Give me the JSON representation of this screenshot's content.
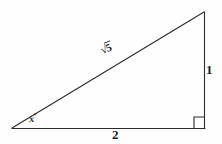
{
  "figure": {
    "type": "right-triangle-diagram",
    "background_color": "#fefefe",
    "stroke_color": "#2b2b2b",
    "stroke_width": 1,
    "vertices": {
      "left": {
        "x": 12,
        "y": 128
      },
      "bottom_right": {
        "x": 205,
        "y": 128
      },
      "top_right": {
        "x": 204,
        "y": 12
      }
    },
    "right_angle_marker": {
      "name": "right-angle-square",
      "corner_x": 205,
      "corner_y": 128,
      "size": 11
    },
    "labels": {
      "vertical_leg": "1",
      "horizontal_leg": "2",
      "hypotenuse_radical": "√",
      "hypotenuse_radicand": "5",
      "angle": "x",
      "angle_degree_symbol": "°"
    }
  }
}
